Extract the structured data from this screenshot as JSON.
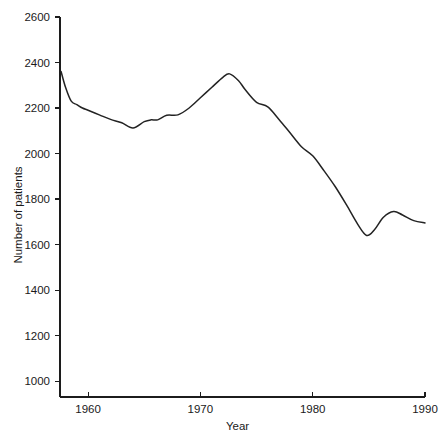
{
  "chart_data": {
    "type": "line",
    "title": "",
    "xlabel": "Year",
    "ylabel": "Number of patients",
    "xlim": [
      1957.5,
      1990
    ],
    "ylim": [
      930,
      2600
    ],
    "grid": false,
    "legend": "none",
    "x_ticks": [
      1960,
      1970,
      1980,
      1990
    ],
    "x_tick_labels": [
      "1960",
      "1970",
      "1980",
      "1990"
    ],
    "y_ticks": [
      1000,
      1200,
      1400,
      1600,
      1800,
      2000,
      2200,
      2400,
      2600
    ],
    "y_tick_labels": [
      "1000",
      "1200",
      "1400",
      "1600",
      "1800",
      "2000",
      "2200",
      "2400",
      "2600"
    ],
    "series": [
      {
        "name": "Number of patients",
        "color": "#232323",
        "x": [
          1957.6,
          1958.0,
          1958.5,
          1959.0,
          1959.5,
          1960.0,
          1961.0,
          1962.0,
          1963.0,
          1964.0,
          1965.0,
          1965.6,
          1966.2,
          1967.0,
          1968.0,
          1969.0,
          1970.0,
          1971.0,
          1972.0,
          1972.6,
          1973.4,
          1974.0,
          1975.0,
          1976.0,
          1977.0,
          1978.0,
          1979.0,
          1980.0,
          1981.0,
          1982.0,
          1983.0,
          1984.0,
          1984.8,
          1985.5,
          1986.3,
          1987.2,
          1988.0,
          1989.0,
          1990.0
        ],
        "y": [
          2360,
          2290,
          2230,
          2215,
          2200,
          2190,
          2170,
          2150,
          2135,
          2112,
          2140,
          2148,
          2148,
          2168,
          2170,
          2200,
          2245,
          2290,
          2335,
          2350,
          2320,
          2280,
          2225,
          2205,
          2150,
          2090,
          2030,
          1990,
          1925,
          1855,
          1775,
          1690,
          1640,
          1665,
          1720,
          1745,
          1730,
          1705,
          1695
        ]
      }
    ]
  },
  "geometry": {
    "plot_left": 60,
    "plot_right": 425,
    "plot_top": 17,
    "plot_bottom": 397
  }
}
